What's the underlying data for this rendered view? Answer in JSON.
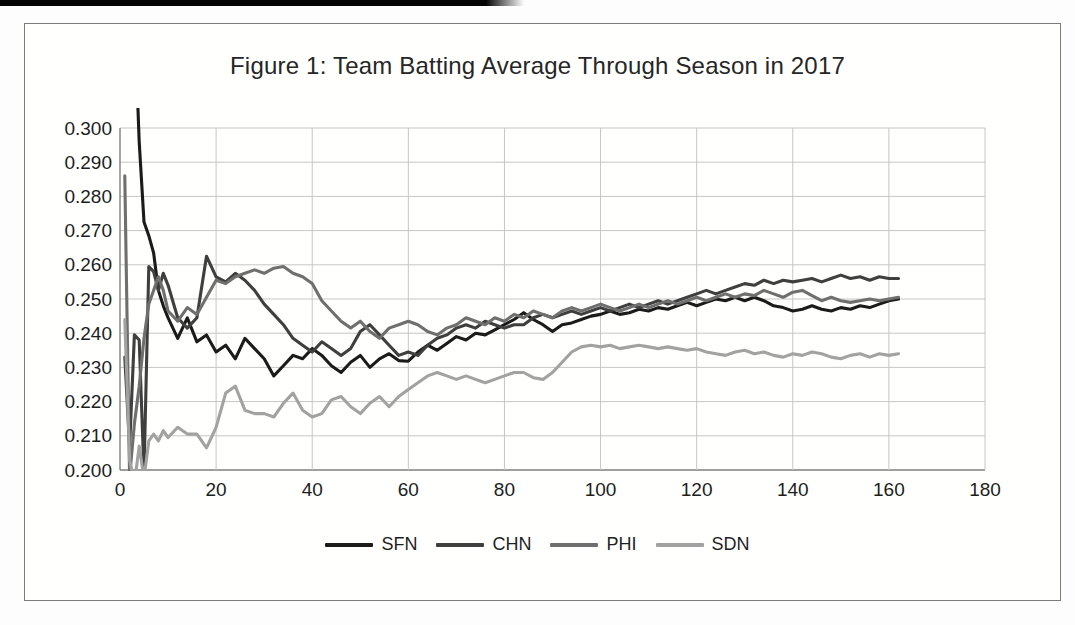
{
  "figure": {
    "title": "Figure 1: Team Batting Average Through Season in 2017"
  },
  "colors": {
    "text": "#262626",
    "grid": "#c6c6c6",
    "axis": "#7f7f7f",
    "frame_border": "#7c7c7c",
    "scan_artifact": "#050505",
    "sfn": "#1b1b1b",
    "chn": "#3f3f3f",
    "phi": "#6f6f6f",
    "sdn": "#a2a2a2"
  },
  "chart_data": {
    "type": "line",
    "title": "Figure 1: Team Batting Average Through Season in 2017",
    "xlabel": "",
    "ylabel": "",
    "xlim": [
      0,
      180
    ],
    "ylim": [
      0.2,
      0.3
    ],
    "x_ticks": [
      0,
      20,
      40,
      60,
      80,
      100,
      120,
      140,
      160,
      180
    ],
    "y_ticks": [
      "0.300",
      "0.290",
      "0.280",
      "0.270",
      "0.260",
      "0.250",
      "0.240",
      "0.230",
      "0.220",
      "0.210",
      "0.200"
    ],
    "grid": true,
    "legend_position": "bottom",
    "x": [
      1,
      2,
      3,
      4,
      5,
      6,
      7,
      8,
      9,
      10,
      12,
      14,
      16,
      18,
      20,
      22,
      24,
      26,
      28,
      30,
      32,
      34,
      36,
      38,
      40,
      42,
      44,
      46,
      48,
      50,
      52,
      54,
      56,
      58,
      60,
      62,
      64,
      66,
      68,
      70,
      72,
      74,
      76,
      78,
      80,
      82,
      84,
      86,
      88,
      90,
      92,
      94,
      96,
      98,
      100,
      102,
      104,
      106,
      108,
      110,
      112,
      114,
      116,
      118,
      120,
      122,
      124,
      126,
      128,
      130,
      132,
      134,
      136,
      138,
      140,
      142,
      144,
      146,
      148,
      150,
      152,
      154,
      156,
      158,
      160,
      162
    ],
    "series": [
      {
        "name": "SFN",
        "color": "#1b1b1b",
        "values": [
          0.5,
          0.42,
          0.333,
          0.296,
          0.2725,
          0.2685,
          0.2635,
          0.2525,
          0.248,
          0.2445,
          0.2385,
          0.2445,
          0.2375,
          0.2395,
          0.2345,
          0.2365,
          0.2325,
          0.2385,
          0.2355,
          0.2325,
          0.2275,
          0.2305,
          0.2335,
          0.2325,
          0.2355,
          0.2335,
          0.2305,
          0.2285,
          0.2315,
          0.2335,
          0.23,
          0.2325,
          0.234,
          0.232,
          0.2318,
          0.2345,
          0.2365,
          0.235,
          0.237,
          0.239,
          0.238,
          0.24,
          0.2395,
          0.241,
          0.2425,
          0.244,
          0.246,
          0.244,
          0.2425,
          0.2405,
          0.2425,
          0.243,
          0.244,
          0.245,
          0.2455,
          0.2465,
          0.2455,
          0.246,
          0.247,
          0.2465,
          0.2475,
          0.247,
          0.248,
          0.249,
          0.248,
          0.249,
          0.25,
          0.2495,
          0.2505,
          0.2495,
          0.2505,
          0.2495,
          0.248,
          0.2475,
          0.2465,
          0.247,
          0.248,
          0.247,
          0.2465,
          0.2475,
          0.247,
          0.248,
          0.2475,
          0.2485,
          0.2495,
          0.25
        ]
      },
      {
        "name": "CHN",
        "color": "#3f3f3f",
        "values": [
          0.233,
          0.207,
          0.2395,
          0.238,
          0.199,
          0.2595,
          0.258,
          0.2525,
          0.2575,
          0.254,
          0.2445,
          0.2415,
          0.2445,
          0.2625,
          0.2565,
          0.255,
          0.2575,
          0.2555,
          0.2525,
          0.2485,
          0.2455,
          0.2425,
          0.2385,
          0.2365,
          0.2345,
          0.2375,
          0.2355,
          0.2335,
          0.2355,
          0.2405,
          0.2425,
          0.2395,
          0.2365,
          0.2335,
          0.2345,
          0.2335,
          0.2365,
          0.2385,
          0.2395,
          0.2415,
          0.2425,
          0.2415,
          0.2435,
          0.2425,
          0.2415,
          0.2425,
          0.2425,
          0.2445,
          0.2455,
          0.2445,
          0.2455,
          0.2465,
          0.2455,
          0.2465,
          0.2475,
          0.2465,
          0.2475,
          0.2485,
          0.2475,
          0.2485,
          0.2495,
          0.2485,
          0.2495,
          0.2505,
          0.2515,
          0.2525,
          0.2515,
          0.2525,
          0.2535,
          0.2545,
          0.254,
          0.2555,
          0.2545,
          0.2555,
          0.255,
          0.2555,
          0.256,
          0.255,
          0.256,
          0.257,
          0.256,
          0.2565,
          0.2555,
          0.2565,
          0.256,
          0.256
        ]
      },
      {
        "name": "PHI",
        "color": "#6f6f6f",
        "values": [
          0.286,
          0.198,
          0.2135,
          0.2245,
          0.2385,
          0.2485,
          0.2525,
          0.2565,
          0.2525,
          0.2465,
          0.2435,
          0.2475,
          0.2455,
          0.2505,
          0.2555,
          0.2545,
          0.2565,
          0.2575,
          0.2585,
          0.2575,
          0.259,
          0.2595,
          0.2575,
          0.2565,
          0.2545,
          0.2495,
          0.2465,
          0.2435,
          0.2415,
          0.2435,
          0.2405,
          0.2385,
          0.2415,
          0.2425,
          0.2435,
          0.2425,
          0.2405,
          0.2395,
          0.2415,
          0.2425,
          0.2445,
          0.2435,
          0.2425,
          0.2445,
          0.2435,
          0.2455,
          0.2445,
          0.2465,
          0.2455,
          0.2445,
          0.2465,
          0.2475,
          0.2465,
          0.2475,
          0.2485,
          0.2475,
          0.2465,
          0.2475,
          0.2485,
          0.2475,
          0.2485,
          0.2495,
          0.2485,
          0.2495,
          0.2505,
          0.2495,
          0.2505,
          0.2515,
          0.2505,
          0.2515,
          0.251,
          0.2525,
          0.2515,
          0.2505,
          0.252,
          0.2525,
          0.251,
          0.2495,
          0.2505,
          0.2495,
          0.249,
          0.2495,
          0.25,
          0.2495,
          0.25,
          0.2505
        ]
      },
      {
        "name": "SDN",
        "color": "#a2a2a2",
        "values": [
          0.244,
          0.203,
          0.196,
          0.207,
          0.1975,
          0.2085,
          0.2105,
          0.2085,
          0.2115,
          0.2095,
          0.2125,
          0.2105,
          0.2105,
          0.2065,
          0.2125,
          0.2225,
          0.2245,
          0.2175,
          0.2165,
          0.2165,
          0.2155,
          0.2195,
          0.2225,
          0.2175,
          0.2155,
          0.2165,
          0.2205,
          0.2215,
          0.2185,
          0.2165,
          0.2195,
          0.2215,
          0.2185,
          0.2215,
          0.2235,
          0.2255,
          0.2275,
          0.2285,
          0.2275,
          0.2265,
          0.2275,
          0.2265,
          0.2255,
          0.2265,
          0.2275,
          0.2285,
          0.2285,
          0.227,
          0.2265,
          0.2285,
          0.2315,
          0.2345,
          0.236,
          0.2365,
          0.236,
          0.2365,
          0.2355,
          0.236,
          0.2365,
          0.236,
          0.2355,
          0.236,
          0.2355,
          0.235,
          0.2355,
          0.2345,
          0.234,
          0.2335,
          0.2345,
          0.235,
          0.234,
          0.2345,
          0.2335,
          0.233,
          0.234,
          0.2335,
          0.2345,
          0.234,
          0.233,
          0.2325,
          0.2335,
          0.234,
          0.233,
          0.234,
          0.2335,
          0.234
        ]
      }
    ]
  }
}
